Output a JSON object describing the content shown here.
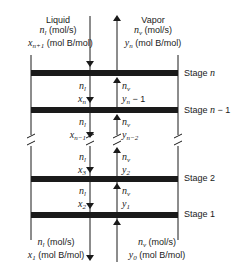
{
  "diagram": {
    "top": {
      "liquid": {
        "heading": "Liquid",
        "flow": "n_l (mol/s)",
        "flow_sym": "n",
        "flow_sub": "l",
        "flow_unit": " (mol/s)",
        "comp_sym": "x",
        "comp_sub": "n+1",
        "comp_unit": " (mol B/mol)"
      },
      "vapor": {
        "heading": "Vapor",
        "flow_sym": "n",
        "flow_sub": "v",
        "flow_unit": " (mol/s)",
        "comp_sym": "y",
        "comp_sub": "n",
        "comp_unit": " (mol B/mol)"
      }
    },
    "stages": [
      {
        "label": "Stage n",
        "text": "Stage ",
        "var": "n",
        "suffix": ""
      },
      {
        "label": "Stage n − 1",
        "text": "Stage ",
        "var": "n",
        "suffix": " − 1"
      },
      {
        "label": "Stage 2",
        "text": "Stage 2",
        "var": "",
        "suffix": ""
      },
      {
        "label": "Stage 1",
        "text": "Stage 1",
        "var": "",
        "suffix": ""
      }
    ],
    "between": [
      {
        "liq_flow_sym": "n",
        "liq_flow_sub": "l",
        "liq_comp_sym": "x",
        "liq_comp_sub": "n",
        "vap_flow_sym": "n",
        "vap_flow_sub": "v",
        "vap_comp_sym": "y",
        "vap_comp_sub": "n",
        "vap_comp_extra": " − 1"
      },
      {
        "liq_flow_sym": "n",
        "liq_flow_sub": "l",
        "liq_comp_sym": "x",
        "liq_comp_sub": "n−1",
        "vap_flow_sym": "n",
        "vap_flow_sub": "v",
        "vap_comp_sym": "y",
        "vap_comp_sub": "n−2",
        "vap_comp_extra": ""
      },
      {
        "liq_flow_sym": "n",
        "liq_flow_sub": "l",
        "liq_comp_sym": "x",
        "liq_comp_sub": "3",
        "vap_flow_sym": "n",
        "vap_flow_sub": "v",
        "vap_comp_sym": "y",
        "vap_comp_sub": "2",
        "vap_comp_extra": ""
      },
      {
        "liq_flow_sym": "n",
        "liq_flow_sub": "l",
        "liq_comp_sym": "x",
        "liq_comp_sub": "2",
        "vap_flow_sym": "n",
        "vap_flow_sub": "v",
        "vap_comp_sym": "y",
        "vap_comp_sub": "1",
        "vap_comp_extra": ""
      }
    ],
    "bottom": {
      "liquid": {
        "flow_sym": "n",
        "flow_sub": "l",
        "flow_unit": " (mol/s)",
        "comp_sym": "x",
        "comp_sub": "1",
        "comp_unit": " (mol B/mol)"
      },
      "vapor": {
        "flow_sym": "n",
        "flow_sub": "v",
        "flow_unit": " (mol/s)",
        "comp_sym": "y",
        "comp_sub": "0",
        "comp_unit": " (mol B/mol)"
      }
    },
    "colors": {
      "line": "#1a1a1a",
      "background": "#ffffff"
    }
  }
}
